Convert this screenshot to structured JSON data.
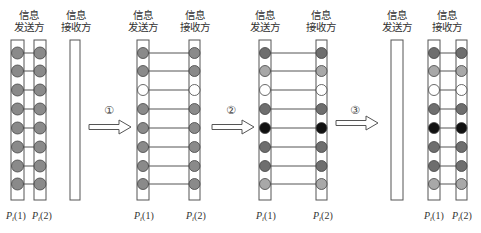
{
  "labels": {
    "sender": "信息\n发送方",
    "sender_line1": "信息",
    "sender_line2": "发送方",
    "receiver_line1": "信息",
    "receiver_line2": "接收方",
    "p1": {
      "base": "P",
      "sub": "i",
      "arg": "(1)"
    },
    "p2": {
      "base": "P",
      "sub": "i",
      "arg": "(2)"
    }
  },
  "steps": [
    "①",
    "②",
    "③"
  ],
  "colors": {
    "strip_stroke": "#555555",
    "rung": "#555555",
    "grey": "#8a8a8a",
    "light_grey": "#a8a8a8",
    "dark_grey": "#6e6e6e",
    "white": "#ffffff",
    "black": "#111111",
    "ball_stroke": "#444444"
  },
  "panels": [
    {
      "name": "initial",
      "sender_pair": true,
      "balls": [
        "grey",
        "grey",
        "grey",
        "grey",
        "grey",
        "grey",
        "grey",
        "grey"
      ]
    },
    {
      "name": "after-step-1",
      "balls": [
        "grey",
        "grey",
        "white",
        "grey",
        "grey",
        "grey",
        "grey",
        "grey"
      ]
    },
    {
      "name": "after-step-2",
      "balls": [
        "dark_grey",
        "light_grey",
        "white",
        "dark_grey",
        "black",
        "dark_grey",
        "dark_grey",
        "light_grey"
      ]
    },
    {
      "name": "after-step-3",
      "balls": [
        "dark_grey",
        "light_grey",
        "white",
        "dark_grey",
        "black",
        "dark_grey",
        "dark_grey",
        "light_grey"
      ]
    }
  ]
}
